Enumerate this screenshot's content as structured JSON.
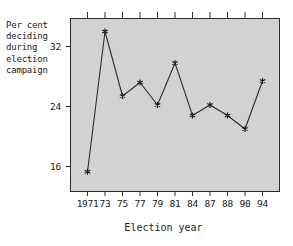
{
  "chart_data": {
    "type": "line",
    "title": "",
    "ylabel": "Per cent\ndeciding\nduring\nelection\ncampaign",
    "xlabel": "Election year",
    "categories": [
      "1971",
      "73",
      "75",
      "77",
      "79",
      "81",
      "84",
      "87",
      "88",
      "90",
      "94"
    ],
    "values": [
      15.3,
      34.0,
      25.4,
      27.2,
      24.2,
      29.8,
      22.8,
      24.2,
      22.8,
      21.0,
      27.4
    ],
    "yticks": [
      16,
      24,
      32
    ],
    "ylim": [
      12.6,
      35.8
    ],
    "xtick_labels": [
      "1971",
      "73",
      "75",
      "77",
      "79",
      "81",
      "84",
      "87",
      "88",
      "90",
      "94"
    ],
    "grid": false,
    "legend": null,
    "marker": "star",
    "line_color": "#2b2b2b",
    "marker_color": "#1a1a1a",
    "plot_background": "#d2d2d2",
    "axis_color": "#2b2b2b"
  },
  "axes": {
    "y_axis_caption": "Per cent\ndeciding\nduring\nelection\ncampaign",
    "x_axis_caption": "Election year"
  }
}
